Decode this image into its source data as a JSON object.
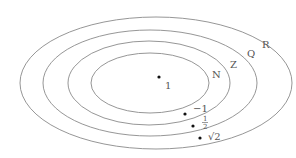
{
  "diagram": {
    "type": "nested-sets-venn",
    "sets": [
      {
        "label": "N"
      },
      {
        "label": "Z"
      },
      {
        "label": "Q"
      },
      {
        "label": "R"
      }
    ],
    "points": [
      {
        "label": "1",
        "set": "N"
      },
      {
        "label": "−1",
        "set": "Z"
      },
      {
        "label_num": "1",
        "label_den": "2",
        "set": "Q"
      },
      {
        "label": "√2",
        "set": "R"
      }
    ],
    "colors": {
      "stroke": "#777777",
      "text": "#555555",
      "dot": "#111111"
    }
  }
}
